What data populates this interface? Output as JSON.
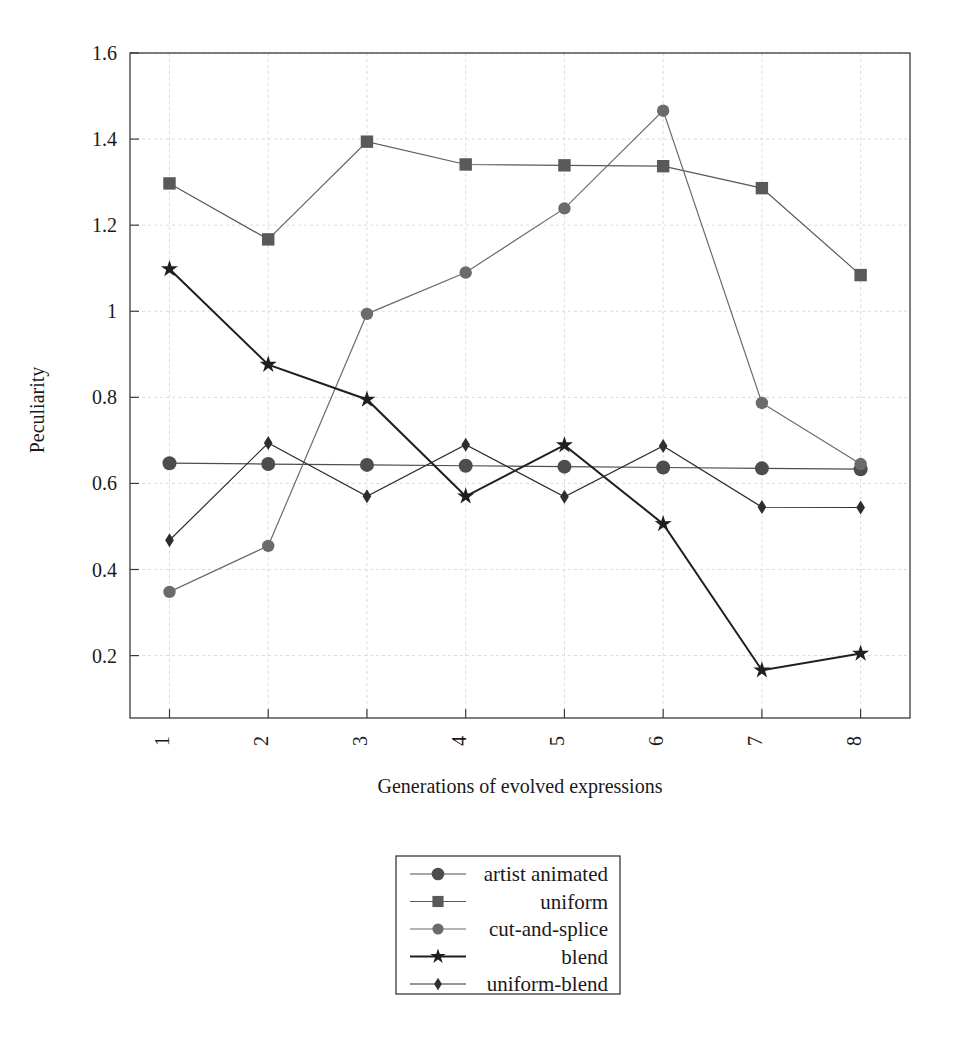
{
  "chart_data": {
    "type": "line",
    "title": "",
    "xlabel": "Generations of evolved expressions",
    "ylabel": "Peculiarity",
    "x": [
      1,
      2,
      3,
      4,
      5,
      6,
      7,
      8
    ],
    "categories": [
      "1",
      "2",
      "3",
      "4",
      "5",
      "6",
      "7",
      "8"
    ],
    "xtick_labels": [
      "1",
      "2",
      "3",
      "4",
      "5",
      "6",
      "7",
      "8"
    ],
    "ytick_labels": [
      "0.2",
      "0.4",
      "0.6",
      "0.8",
      "1",
      "1.2",
      "1.4",
      "1.6"
    ],
    "ytick_values": [
      0.2,
      0.4,
      0.6,
      0.8,
      1.0,
      1.2,
      1.4,
      1.6
    ],
    "xlim": [
      0.6,
      8.5
    ],
    "ylim": [
      0.055,
      1.6
    ],
    "grid": true,
    "legend_position": "below-center",
    "series": [
      {
        "name": "artist animated",
        "marker": "circle-large",
        "color": "#4d4d4d",
        "values": [
          0.647,
          0.645,
          0.643,
          0.641,
          0.639,
          0.637,
          0.635,
          0.633
        ]
      },
      {
        "name": "uniform",
        "marker": "square",
        "color": "#595959",
        "values": [
          1.297,
          1.167,
          1.394,
          1.341,
          1.339,
          1.337,
          1.286,
          1.084
        ]
      },
      {
        "name": "cut-and-splice",
        "marker": "circle",
        "color": "#6b6b6b",
        "values": [
          0.348,
          0.455,
          0.994,
          1.09,
          1.239,
          1.466,
          0.787,
          0.645
        ]
      },
      {
        "name": "blend",
        "marker": "star",
        "color": "#1f1f1f",
        "values": [
          1.098,
          0.876,
          0.795,
          0.57,
          0.689,
          0.506,
          0.166,
          0.205
        ]
      },
      {
        "name": "uniform-blend",
        "marker": "diamond",
        "color": "#2e2e2e",
        "values": [
          0.468,
          0.694,
          0.57,
          0.69,
          0.569,
          0.687,
          0.545,
          0.544
        ]
      }
    ]
  },
  "legend": {
    "entries": [
      {
        "label": "artist animated"
      },
      {
        "label": "uniform"
      },
      {
        "label": "cut-and-splice"
      },
      {
        "label": "blend"
      },
      {
        "label": "uniform-blend"
      }
    ]
  }
}
